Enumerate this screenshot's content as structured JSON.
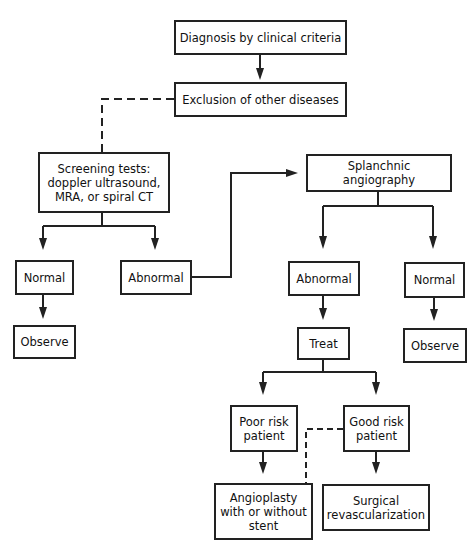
{
  "nodes": {
    "diagnosis": "Diagnosis by clinical criteria",
    "exclusion": "Exclusion of other diseases",
    "screening": "Screening tests:\ndoppler ultrasound,\nMRA, or spiral CT",
    "screen_normal": "Normal",
    "screen_abnormal": "Abnormal",
    "screen_observe": "Observe",
    "angiography": "Splanchnic angiography",
    "angio_abnormal": "Abnormal",
    "angio_normal": "Normal",
    "treat": "Treat",
    "angio_observe": "Observe",
    "poor_risk": "Poor risk\npatient",
    "good_risk": "Good risk\npatient",
    "angioplasty": "Angioplasty\nwith or without\nstent",
    "surgical": "Surgical\nrevascularization"
  },
  "edges": [
    {
      "from": "diagnosis",
      "to": "exclusion",
      "style": "solid"
    },
    {
      "from": "exclusion",
      "to": "screening",
      "style": "dashed"
    },
    {
      "from": "screening",
      "to": "screen_normal",
      "style": "solid"
    },
    {
      "from": "screening",
      "to": "screen_abnormal",
      "style": "solid"
    },
    {
      "from": "screen_normal",
      "to": "screen_observe",
      "style": "solid"
    },
    {
      "from": "screen_abnormal",
      "to": "angiography",
      "style": "solid"
    },
    {
      "from": "angiography",
      "to": "angio_abnormal",
      "style": "solid"
    },
    {
      "from": "angiography",
      "to": "angio_normal",
      "style": "solid"
    },
    {
      "from": "angio_abnormal",
      "to": "treat",
      "style": "solid"
    },
    {
      "from": "angio_normal",
      "to": "angio_observe",
      "style": "solid"
    },
    {
      "from": "treat",
      "to": "poor_risk",
      "style": "solid"
    },
    {
      "from": "treat",
      "to": "good_risk",
      "style": "solid"
    },
    {
      "from": "poor_risk",
      "to": "angioplasty",
      "style": "solid"
    },
    {
      "from": "good_risk",
      "to": "angioplasty",
      "style": "dashed"
    },
    {
      "from": "good_risk",
      "to": "surgical",
      "style": "solid"
    }
  ],
  "colors": {
    "line": "#222222",
    "background": "#ffffff"
  }
}
